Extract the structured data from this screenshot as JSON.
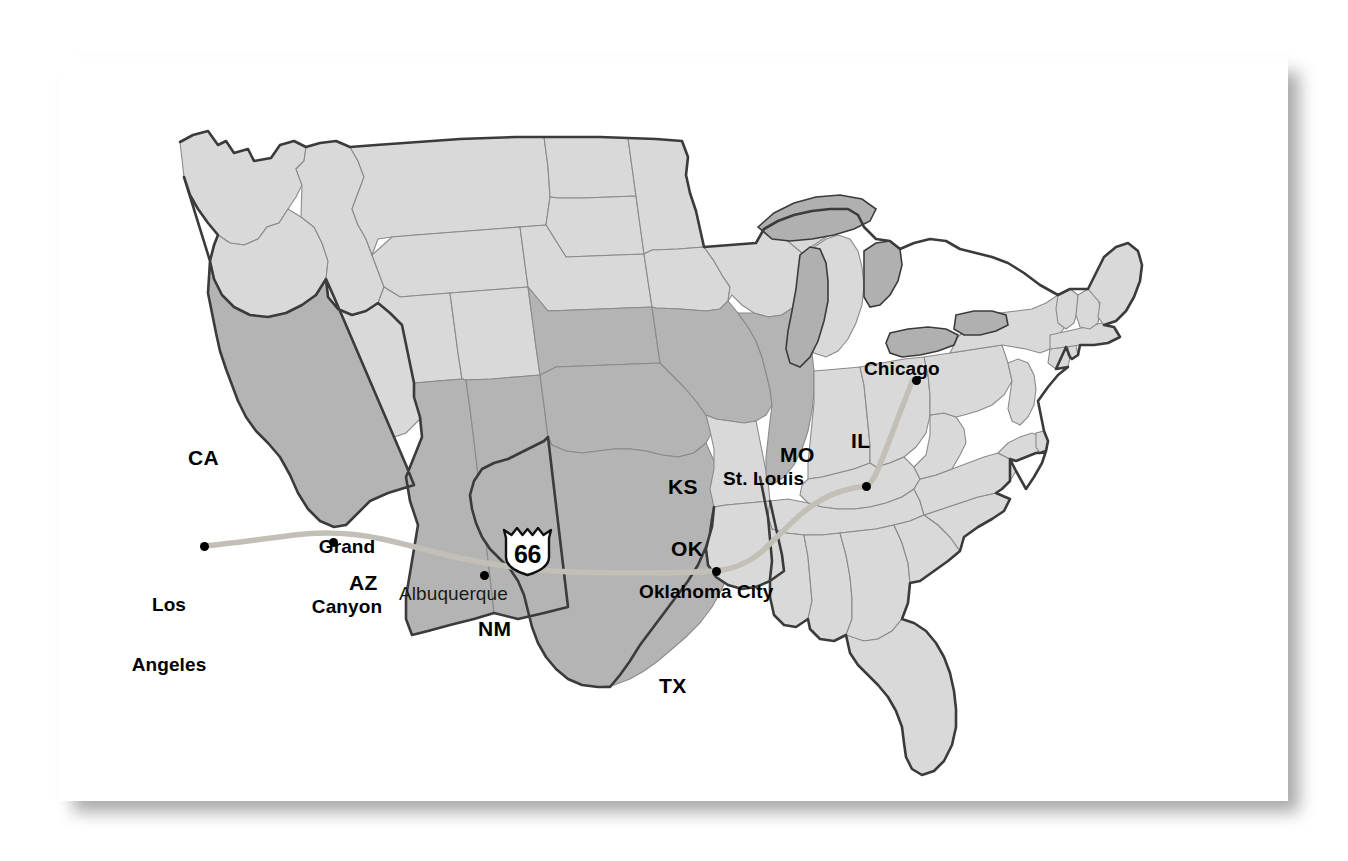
{
  "map": {
    "title": "U.S. Route 66 corridor map",
    "background_color": "#ffffff",
    "card_color": "#ffffff",
    "state_fill_default": "#d9d9d9",
    "state_fill_highlight": "#b4b4b4",
    "lake_fill": "#b0b0b0",
    "outline_color": "#3b3b3b",
    "interior_border_color": "#7a7a7a",
    "route_color": "#c2bfb6",
    "route_label": "66"
  },
  "route": {
    "shield_number": "66",
    "shield_name": "us-route-66-shield"
  },
  "state_labels": [
    {
      "code": "CA",
      "name": "California",
      "x": 130,
      "y": 390,
      "highlight": true
    },
    {
      "code": "AZ",
      "name": "Arizona",
      "x": 291,
      "y": 515,
      "highlight": true
    },
    {
      "code": "NM",
      "name": "New Mexico",
      "x": 420,
      "y": 561,
      "highlight": true
    },
    {
      "code": "TX",
      "name": "Texas",
      "x": 601,
      "y": 618,
      "highlight": true
    },
    {
      "code": "OK",
      "name": "Oklahoma",
      "x": 613,
      "y": 481,
      "highlight": true
    },
    {
      "code": "KS",
      "name": "Kansas",
      "x": 610,
      "y": 419,
      "highlight": true
    },
    {
      "code": "MO",
      "name": "Missouri",
      "x": 722,
      "y": 387,
      "highlight": true
    },
    {
      "code": "IL",
      "name": "Illinois",
      "x": 793,
      "y": 373,
      "highlight": true
    }
  ],
  "city_labels": [
    {
      "name": "Los Angeles",
      "lines": [
        "Los",
        "Angeles"
      ],
      "x": 100,
      "y": 500,
      "dot_x": 146,
      "dot_y": 489,
      "bold": true,
      "align": "center"
    },
    {
      "name": "Albuquerque",
      "lines": [
        "Albuquerque"
      ],
      "x": 398,
      "y": 530,
      "dot_x": 426,
      "dot_y": 518,
      "bold": false,
      "align": "left"
    },
    {
      "name": "Oklahoma City",
      "lines": [
        "Oklahoma City"
      ],
      "x": 641,
      "y": 527,
      "dot_x": 658,
      "dot_y": 514,
      "bold": true,
      "align": "left"
    },
    {
      "name": "St. Louis",
      "lines": [
        "St. Louis"
      ],
      "x": 725,
      "y": 415,
      "dot_x": 808,
      "dot_y": 429,
      "bold": true,
      "align": "left"
    },
    {
      "name": "Chicago",
      "lines": [
        "Chicago"
      ],
      "x": 864,
      "y": 305,
      "dot_x": 858,
      "dot_y": 323,
      "bold": true,
      "align": "left"
    }
  ],
  "poi_labels": [
    {
      "name": "Grand Canyon",
      "lines": [
        "Grand",
        "Canyon"
      ],
      "x": 289,
      "y": 449,
      "dot_x": 275,
      "dot_y": 485
    }
  ]
}
